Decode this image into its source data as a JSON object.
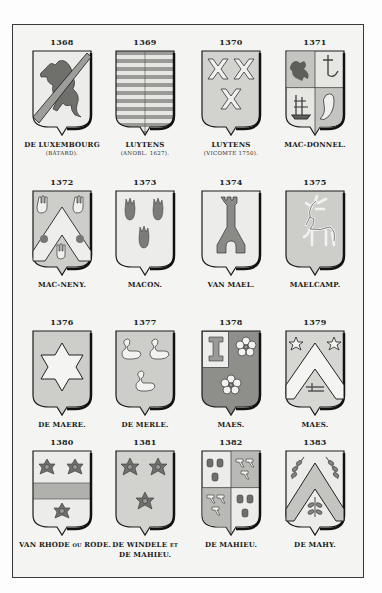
{
  "plate": {
    "colors": {
      "paper": "#f4f4f2",
      "frame": "#3a3a3a",
      "field_light": "#ececea",
      "field_gray": "#b9b9b6",
      "field_dark": "#8e8e8b",
      "charge": "#6f6f6c",
      "outline": "#1c1c1c"
    },
    "entries": [
      {
        "number": "1368",
        "name": "DE LUXEMBOURG",
        "note": "(BÂTARD).",
        "blazon": "lion rampant with bend sinister",
        "field": "light"
      },
      {
        "number": "1369",
        "name": "LUYTENS",
        "note": "(ANOBL. 1627).",
        "blazon": "barry with pale line",
        "field": "barry"
      },
      {
        "number": "1370",
        "name": "LUYTENS",
        "note": "(VICOMTE 1750).",
        "blazon": "three crosses of Saint Andrew",
        "field": "gray"
      },
      {
        "number": "1371",
        "name": "MAC-DONNEL.",
        "note": "",
        "blazon": "quarterly: lion, cross, ship, fish",
        "field": "quarterly"
      },
      {
        "number": "1372",
        "name": "MAC-NENY.",
        "note": "",
        "blazon": "chevron with hands and flowers",
        "field": "gray"
      },
      {
        "number": "1373",
        "name": "MACON.",
        "note": "",
        "blazon": "three flames",
        "field": "light"
      },
      {
        "number": "1374",
        "name": "VAN MAEL.",
        "note": "",
        "blazon": "tower",
        "field": "light"
      },
      {
        "number": "1375",
        "name": "MAELCAMP.",
        "note": "",
        "blazon": "stag",
        "field": "gray"
      },
      {
        "number": "1376",
        "name": "DE MAERE.",
        "note": "",
        "blazon": "six-pointed star",
        "field": "gray"
      },
      {
        "number": "1377",
        "name": "DE MERLE.",
        "note": "",
        "blazon": "three swans",
        "field": "gray"
      },
      {
        "number": "1378",
        "name": "MAES.",
        "note": "",
        "blazon": "canton with bone, two cinquefoils",
        "field": "dark"
      },
      {
        "number": "1379",
        "name": "MAES.",
        "note": "",
        "blazon": "chevron between two stars and a hook",
        "field": "gray"
      },
      {
        "number": "1380",
        "name": "VAN RHODE",
        "name_suffix": "OU",
        "name_tail": "RODE.",
        "note": "",
        "blazon": "fess between three roses",
        "field": "light"
      },
      {
        "number": "1381",
        "name": "DE WINDELE",
        "name_suffix": "ET",
        "name_line2": "DE MAHIEU.",
        "note": "",
        "blazon": "three roses",
        "field": "gray"
      },
      {
        "number": "1382",
        "name": "DE MAHIEU.",
        "note": "",
        "blazon": "quarterly: mallets and hammers",
        "field": "quarterly"
      },
      {
        "number": "1383",
        "name": "DE MAHY.",
        "note": "",
        "blazon": "chevron between three branches",
        "field": "gray"
      }
    ]
  }
}
